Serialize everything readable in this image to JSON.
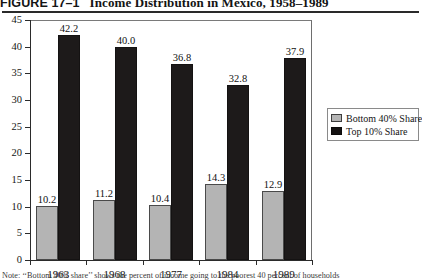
{
  "title": {
    "figure_label": "FIGURE 17–1",
    "caption": "Income Distribution in Mexico, 1958–1989",
    "full": "FIGURE 17–1   Income Distribution in Mexico, 1958–1989"
  },
  "note": {
    "text": "Note: ‘‘Bottom 40% share’’ shows the percent of income going to the poorest 40 percent of households"
  },
  "legend": {
    "position": "outside-right",
    "items": [
      {
        "label": "Bottom 40% Share",
        "color": "#b4b4b4",
        "swatch": "low"
      },
      {
        "label": "Top 10% Share",
        "color": "#1d1a1a",
        "swatch": "high"
      }
    ]
  },
  "axes": {
    "y_ticks": [
      "0",
      "5",
      "10",
      "15",
      "20",
      "25",
      "30",
      "35",
      "40",
      "45"
    ],
    "x_ticks": [
      "1963",
      "1968",
      "1977",
      "1984",
      "1989"
    ]
  },
  "chart_data": {
    "type": "bar",
    "title": "Income Distribution in Mexico, 1958–1989",
    "xlabel": "",
    "ylabel": "",
    "ylim": [
      0,
      45
    ],
    "ytick_step": 5,
    "grid": false,
    "legend_position": "outside-right",
    "categories": [
      "1963",
      "1968",
      "1977",
      "1984",
      "1989"
    ],
    "series": [
      {
        "name": "Bottom 40% Share",
        "color": "#b4b4b4",
        "values": [
          10.2,
          11.2,
          10.4,
          14.3,
          12.9
        ],
        "labels": [
          "10.2",
          "11.2",
          "10.4",
          "14.3",
          "12.9"
        ]
      },
      {
        "name": "Top 10% Share",
        "color": "#1d1a1a",
        "values": [
          42.2,
          40.0,
          36.8,
          32.8,
          37.9
        ],
        "labels": [
          "42.2",
          "40.0",
          "36.8",
          "32.8",
          "37.9"
        ]
      }
    ],
    "annotations": [
      "Note: ‘‘Bottom 40% share’’ shows the percent of income going to the poorest 40 percent of households"
    ]
  }
}
